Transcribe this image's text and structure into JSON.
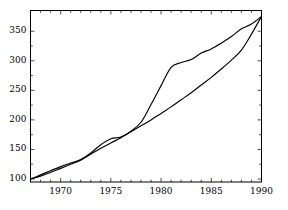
{
  "chart_data": {
    "type": "line",
    "title": "",
    "subtitle": "",
    "xlabel": "",
    "ylabel": "",
    "xlim": [
      1967,
      1990
    ],
    "ylim": [
      95,
      385
    ],
    "grid": false,
    "legend": null,
    "legend_position": "none",
    "xticks": [
      1970,
      1975,
      1980,
      1985,
      1990
    ],
    "xticklabels": [
      "1970",
      "1975",
      "1980",
      "1985",
      "1990"
    ],
    "xminor_step": 1,
    "yticks": [
      100,
      150,
      200,
      250,
      300,
      350
    ],
    "yticklabels": [
      "100",
      "150",
      "200",
      "250",
      "300",
      "350"
    ],
    "line_color": "#000000",
    "axis_color": "#000000",
    "background": "#ffffff",
    "x": [
      1967,
      1968,
      1969,
      1970,
      1971,
      1972,
      1973,
      1974,
      1975,
      1976,
      1977,
      1978,
      1979,
      1980,
      1981,
      1982,
      1983,
      1984,
      1985,
      1986,
      1987,
      1988,
      1989,
      1990
    ],
    "series": [
      {
        "name": "upper-series",
        "values": [
          100,
          107,
          114,
          121,
          127,
          133,
          144,
          158,
          168,
          171,
          181,
          196,
          226,
          258,
          289,
          297,
          302,
          313,
          320,
          330,
          341,
          354,
          362,
          375
        ]
      },
      {
        "name": "lower-series",
        "values": [
          100,
          105,
          111,
          118,
          125,
          132,
          142,
          152,
          161,
          170,
          180,
          190,
          200,
          211,
          222,
          234,
          246,
          259,
          272,
          286,
          301,
          318,
          345,
          375
        ]
      }
    ]
  }
}
